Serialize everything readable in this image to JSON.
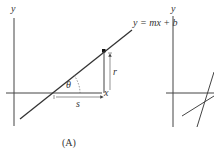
{
  "panel_a": {
    "y_axis_label": "y",
    "x_axis_label": "x",
    "equation": "y = mx + b",
    "angle_label": "θ",
    "rise_label": "r",
    "run_label": "s",
    "caption": "(A)"
  },
  "panel_b": {
    "y_axis_label": "y"
  },
  "colors": {
    "line": "#333333",
    "axis": "#444444",
    "background": "#ffffff"
  }
}
